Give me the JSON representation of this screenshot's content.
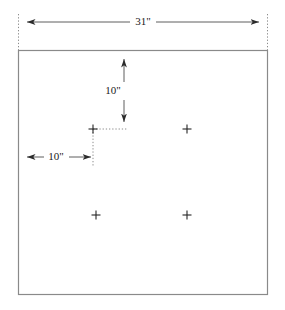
{
  "drawing": {
    "title": "Panel hole layout dimension drawing",
    "units": "inches",
    "colors": {
      "panel_outline": "#8a8a8a",
      "dimension_line": "#4d4d4d",
      "extension_line": "#8c8c8c",
      "leader_line": "#8c8c8c",
      "marker": "#262626",
      "text": "#1a1a1a",
      "background": "#ffffff"
    },
    "panel": {
      "label": "panel-outline",
      "x": 18,
      "y": 50,
      "width": 250,
      "height": 245
    },
    "dimensions": [
      {
        "name": "overall-width",
        "label": "31\"",
        "orientation": "horizontal",
        "value": 31,
        "unit": "in",
        "line_y": 22,
        "from_x": 18,
        "to_x": 268,
        "text_x": 143,
        "text_y": 22,
        "arrow_direction": "outward"
      },
      {
        "name": "hole-offset-top",
        "label": "10\"",
        "orientation": "vertical",
        "value": 10,
        "unit": "in",
        "line_x": 124,
        "from_y": 52,
        "to_y": 129,
        "text_x": 112,
        "text_y": 91,
        "arrow_direction": "both"
      },
      {
        "name": "hole-offset-left",
        "label": "10\"",
        "orientation": "horizontal",
        "value": 10,
        "unit": "in",
        "line_y": 157,
        "from_x": 19,
        "to_x": 93,
        "text_x": 56,
        "text_y": 157,
        "arrow_direction": "both"
      }
    ],
    "extension_lines": [
      {
        "name": "ext-left",
        "x": 18,
        "y1": 14,
        "y2": 50
      },
      {
        "name": "ext-right",
        "x": 268,
        "y1": 14,
        "y2": 50
      }
    ],
    "leader_lines": [
      {
        "name": "leader-horizontal-to-hole",
        "x1": 93,
        "y1": 129,
        "x2": 124,
        "y2": 129
      },
      {
        "name": "leader-vertical-to-hole",
        "x1": 93,
        "y1": 129,
        "x2": 93,
        "y2": 165
      }
    ],
    "hole_markers": [
      {
        "name": "hole-top-left",
        "x": 93,
        "y": 129,
        "size": 5
      },
      {
        "name": "hole-top-right",
        "x": 187,
        "y": 129,
        "size": 5
      },
      {
        "name": "hole-bottom-left",
        "x": 96,
        "y": 215,
        "size": 5
      },
      {
        "name": "hole-bottom-right",
        "x": 187,
        "y": 215,
        "size": 5
      }
    ]
  }
}
